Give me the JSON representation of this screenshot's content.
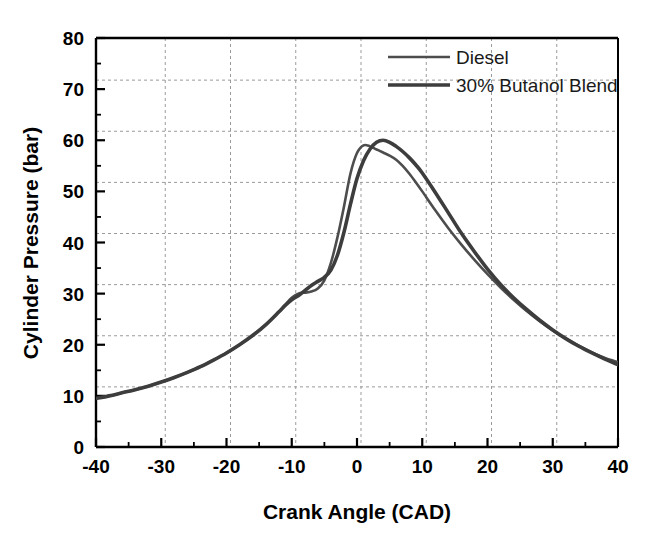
{
  "chart_data": {
    "type": "line",
    "title": "",
    "xlabel": "Crank Angle (CAD)",
    "ylabel": "Cylinder Pressure (bar)",
    "xlim": [
      -40,
      40
    ],
    "ylim": [
      0,
      80
    ],
    "xticks": [
      -40,
      -30,
      -20,
      -10,
      0,
      10,
      20,
      30,
      40
    ],
    "yticks": [
      0,
      10,
      20,
      30,
      40,
      50,
      60,
      70,
      80
    ],
    "xtick_labels": [
      "-40",
      "-30",
      "-20",
      "-10",
      "0",
      "10",
      "20",
      "30",
      "40"
    ],
    "ytick_labels": [
      "0",
      "10",
      "20",
      "30",
      "40",
      "50",
      "60",
      "70",
      "80"
    ],
    "grid": true,
    "grid_style": "dashed",
    "grid_color": "#9a9a9a",
    "legend_position": "top-right",
    "x": [
      -40,
      -38,
      -36,
      -34,
      -32,
      -30,
      -28,
      -26,
      -24,
      -22,
      -20,
      -18,
      -16,
      -14,
      -12,
      -11,
      -10,
      -9,
      -8,
      -7,
      -6,
      -5,
      -4,
      -3,
      -2,
      -1,
      0,
      1,
      2,
      3,
      4,
      5,
      6,
      7,
      8,
      9,
      10,
      12,
      14,
      16,
      18,
      20,
      22,
      24,
      26,
      28,
      30,
      32,
      34,
      36,
      38,
      40
    ],
    "series": [
      {
        "name": "Diesel",
        "color": "#4d4d4d",
        "line_width": 2.6,
        "peak_value": 59.0,
        "peak_x": 1,
        "values": [
          9.5,
          10.0,
          10.6,
          11.2,
          11.9,
          12.7,
          13.6,
          14.6,
          15.7,
          17.0,
          18.4,
          20.0,
          21.8,
          23.9,
          26.4,
          27.8,
          29.2,
          30.0,
          30.2,
          30.4,
          31.0,
          32.6,
          36.0,
          41.0,
          47.0,
          53.5,
          57.5,
          59.0,
          58.8,
          58.2,
          57.6,
          57.0,
          56.2,
          55.0,
          53.5,
          51.8,
          50.0,
          46.3,
          42.8,
          39.6,
          36.6,
          33.8,
          31.2,
          28.8,
          26.6,
          24.6,
          22.8,
          21.2,
          19.8,
          18.5,
          17.4,
          16.6
        ]
      },
      {
        "name": "30% Butanol Blend",
        "color": "#3d3d3d",
        "line_width": 3.6,
        "peak_value": 60.0,
        "peak_x": 4,
        "values": [
          9.5,
          10.0,
          10.6,
          11.2,
          11.9,
          12.7,
          13.6,
          14.6,
          15.7,
          17.0,
          18.4,
          20.0,
          21.8,
          23.9,
          26.4,
          27.7,
          28.8,
          29.6,
          30.6,
          31.6,
          32.4,
          33.2,
          34.6,
          37.5,
          42.0,
          47.5,
          52.5,
          56.0,
          58.3,
          59.6,
          60.0,
          59.6,
          58.8,
          57.8,
          56.6,
          55.2,
          53.6,
          49.8,
          45.8,
          41.8,
          38.2,
          34.8,
          31.8,
          29.2,
          26.9,
          24.8,
          22.9,
          21.2,
          19.7,
          18.4,
          17.2,
          16.1
        ]
      }
    ]
  },
  "legend": {
    "entries": [
      {
        "label": "Diesel"
      },
      {
        "label": "30% Butanol Blend"
      }
    ]
  }
}
